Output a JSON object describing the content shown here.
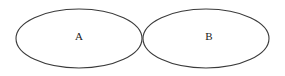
{
  "diagram": {
    "type": "venn",
    "background": "#ffffff",
    "stroke_color": "#3a3a3a",
    "sets": [
      {
        "label": "A",
        "cx": 79,
        "cy": 38.5,
        "rx": 63,
        "ry": 29.5
      },
      {
        "label": "B",
        "cx": 206,
        "cy": 38.5,
        "rx": 63,
        "ry": 29.5
      }
    ],
    "relationship": "disjoint (tangent ellipses)"
  }
}
